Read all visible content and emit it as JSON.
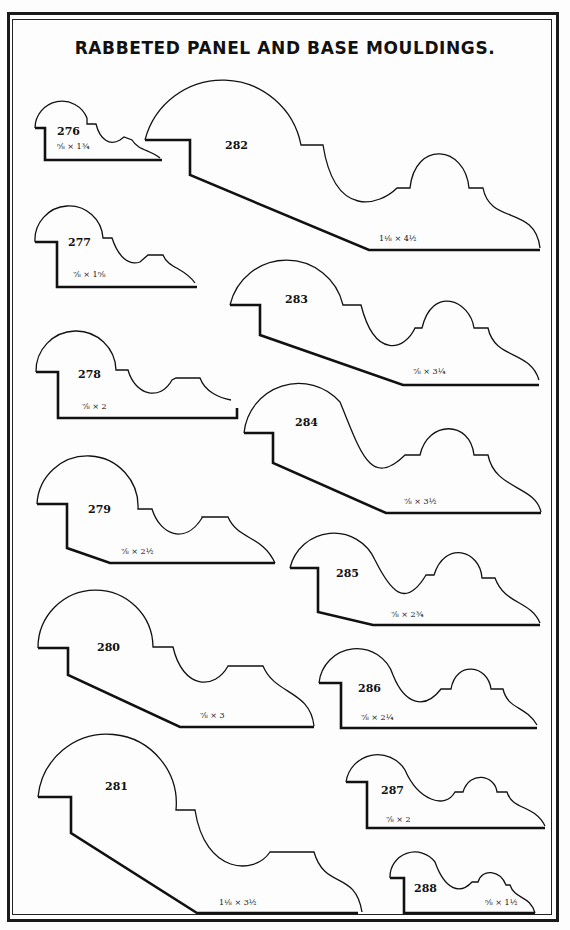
{
  "page": {
    "title": "RABBETED PANEL AND BASE MOULDINGS."
  },
  "mouldings": [
    {
      "number": "276",
      "size": "⅝ × 1¾"
    },
    {
      "number": "277",
      "size": "⅞ × 1⅝"
    },
    {
      "number": "278",
      "size": "⅞ × 2"
    },
    {
      "number": "279",
      "size": "⅞ × 2½"
    },
    {
      "number": "280",
      "size": "⅞ × 3"
    },
    {
      "number": "281",
      "size": "1⅛ × 3½"
    },
    {
      "number": "282",
      "size": "1⅛ × 4½"
    },
    {
      "number": "283",
      "size": "⅞ × 3¼"
    },
    {
      "number": "284",
      "size": "⅞ × 3½"
    },
    {
      "number": "285",
      "size": "⅞ × 2¾"
    },
    {
      "number": "286",
      "size": "⅞ × 2¼"
    },
    {
      "number": "287",
      "size": "⅞ × 2"
    },
    {
      "number": "288",
      "size": "⅝ × 1½"
    }
  ]
}
